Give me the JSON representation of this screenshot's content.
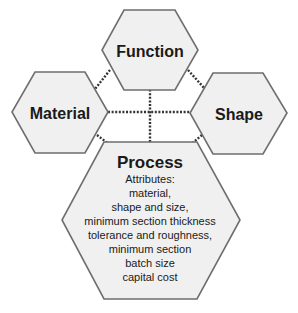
{
  "diagram": {
    "nodes": {
      "function": {
        "label": "Function"
      },
      "material": {
        "label": "Material"
      },
      "shape": {
        "label": "Shape"
      },
      "process": {
        "label": "Process",
        "attributes_heading": "Attributes:",
        "attributes": [
          "material,",
          "shape and size,",
          "minimum section thickness",
          "tolerance and roughness,",
          "minimum section",
          "batch size",
          "capital cost"
        ]
      }
    },
    "connections": [
      {
        "from": "function",
        "to": "material",
        "style": "dotted"
      },
      {
        "from": "function",
        "to": "shape",
        "style": "dotted"
      },
      {
        "from": "function",
        "to": "process",
        "style": "dotted"
      },
      {
        "from": "material",
        "to": "shape",
        "style": "dotted"
      },
      {
        "from": "material",
        "to": "process",
        "style": "dotted"
      },
      {
        "from": "shape",
        "to": "process",
        "style": "dotted"
      }
    ],
    "colors": {
      "hex_fill": "#f0f0f0",
      "hex_stroke": "#6e6e6e",
      "link": "#333333",
      "text": "#1a1a1a"
    }
  }
}
